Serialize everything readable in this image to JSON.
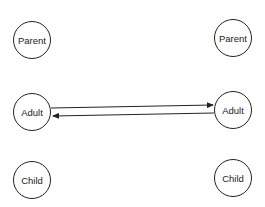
{
  "diagram": {
    "left_column": {
      "parent": "Parent",
      "adult": "Adult",
      "child": "Child"
    },
    "right_column": {
      "parent": "Parent",
      "adult": "Adult",
      "child": "Child"
    },
    "edges": [
      {
        "from": "left.adult",
        "to": "right.adult",
        "direction": "right"
      },
      {
        "from": "right.adult",
        "to": "left.adult",
        "direction": "left"
      }
    ],
    "colors": {
      "stroke": "#222222",
      "background": "#ffffff"
    }
  }
}
